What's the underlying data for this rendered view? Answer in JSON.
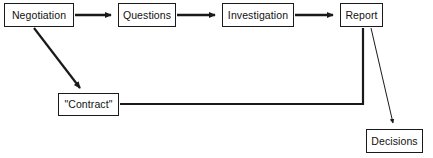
{
  "diagram": {
    "type": "flowchart",
    "title": "",
    "background_color": "#ffffff",
    "line_color": "#1a1a1a",
    "text_color": "#111111",
    "nodes": [
      {
        "id": "negotiation",
        "label": "Negotiation",
        "shape": "rectangle",
        "x": 4,
        "y": 3,
        "width": 70,
        "height": 24
      },
      {
        "id": "questions",
        "label": "Questions",
        "shape": "rectangle",
        "x": 118,
        "y": 3,
        "width": 58,
        "height": 24
      },
      {
        "id": "investigation",
        "label": "Investigation",
        "shape": "rectangle",
        "x": 222,
        "y": 3,
        "width": 72,
        "height": 24
      },
      {
        "id": "report",
        "label": "Report",
        "shape": "rectangle",
        "x": 340,
        "y": 3,
        "width": 43,
        "height": 24
      },
      {
        "id": "contract",
        "label": "\"Contract\"",
        "shape": "rectangle",
        "x": 58,
        "y": 93,
        "width": 61,
        "height": 23
      },
      {
        "id": "decisions",
        "label": "Decisions",
        "shape": "rectangle",
        "x": 366,
        "y": 129,
        "width": 57,
        "height": 24
      }
    ],
    "edges": [
      {
        "id": "negotiation-to-questions",
        "from": "negotiation",
        "to": "questions",
        "style": "thick",
        "arrowhead": "solid-triangle",
        "label": ""
      },
      {
        "id": "questions-to-investigation",
        "from": "questions",
        "to": "investigation",
        "style": "thick",
        "arrowhead": "solid-triangle",
        "label": ""
      },
      {
        "id": "investigation-to-report",
        "from": "investigation",
        "to": "report",
        "style": "thick",
        "arrowhead": "solid-triangle",
        "label": ""
      },
      {
        "id": "negotiation-to-contract",
        "from": "negotiation",
        "to": "contract",
        "style": "thick-diagonal",
        "arrowhead": "solid-triangle",
        "label": ""
      },
      {
        "id": "report-to-contract",
        "from": "report",
        "to": "contract",
        "style": "thick-elbow",
        "arrowhead": "none",
        "label": ""
      },
      {
        "id": "report-to-decisions",
        "from": "report",
        "to": "decisions",
        "style": "thin-diagonal",
        "arrowhead": "small-triangle",
        "label": ""
      }
    ]
  }
}
